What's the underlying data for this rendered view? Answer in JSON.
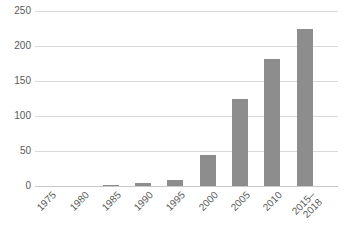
{
  "chart_data": {
    "type": "bar",
    "categories": [
      "1975",
      "1980",
      "1985",
      "1990",
      "1995",
      "2000",
      "2005",
      "2010",
      "2015–\n2018"
    ],
    "values": [
      0,
      0,
      2,
      4,
      8,
      44,
      125,
      182,
      225
    ],
    "title": "",
    "xlabel": "",
    "ylabel": "",
    "ylim": [
      0,
      250
    ],
    "yticks": [
      0,
      50,
      100,
      150,
      200,
      250
    ],
    "grid": true,
    "legend": "none",
    "x_tick_rotation_deg": 45,
    "colors": {
      "bar": "#8d8d8d",
      "gridline": "#d9d9d9",
      "baseline": "#c9c9c9",
      "tick_text": "#595959",
      "background": "#ffffff"
    }
  }
}
